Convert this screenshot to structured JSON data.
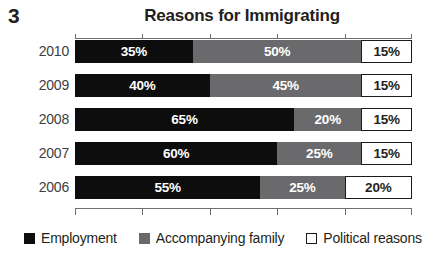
{
  "figure": {
    "number": "3",
    "title": "Reasons for Immigrating"
  },
  "legend": {
    "items": [
      {
        "label": "Employment",
        "swatch": "black-square-icon",
        "color": "#0d0d0d"
      },
      {
        "label": "Accompanying family",
        "swatch": "gray-square-icon",
        "color": "#6a6a6c"
      },
      {
        "label": "Political reasons",
        "swatch": "white-square-icon",
        "color": "#ffffff"
      }
    ]
  },
  "rows": [
    {
      "year": "2010",
      "segments": [
        {
          "series": "Employment",
          "value": 35,
          "label": "35%"
        },
        {
          "series": "Accompanying family",
          "value": 50,
          "label": "50%"
        },
        {
          "series": "Political reasons",
          "value": 15,
          "label": "15%"
        }
      ]
    },
    {
      "year": "2009",
      "segments": [
        {
          "series": "Employment",
          "value": 40,
          "label": "40%"
        },
        {
          "series": "Accompanying family",
          "value": 45,
          "label": "45%"
        },
        {
          "series": "Political reasons",
          "value": 15,
          "label": "15%"
        }
      ]
    },
    {
      "year": "2008",
      "segments": [
        {
          "series": "Employment",
          "value": 65,
          "label": "65%"
        },
        {
          "series": "Accompanying family",
          "value": 20,
          "label": "20%"
        },
        {
          "series": "Political reasons",
          "value": 15,
          "label": "15%"
        }
      ]
    },
    {
      "year": "2007",
      "segments": [
        {
          "series": "Employment",
          "value": 60,
          "label": "60%"
        },
        {
          "series": "Accompanying family",
          "value": 25,
          "label": "25%"
        },
        {
          "series": "Political reasons",
          "value": 15,
          "label": "15%"
        }
      ]
    },
    {
      "year": "2006",
      "segments": [
        {
          "series": "Employment",
          "value": 55,
          "label": "55%"
        },
        {
          "series": "Accompanying family",
          "value": 25,
          "label": "25%"
        },
        {
          "series": "Political reasons",
          "value": 20,
          "label": "20%"
        }
      ]
    }
  ],
  "axis": {
    "ticks": [
      0,
      20,
      40,
      60,
      80,
      100
    ],
    "tick_labels_visible": false
  },
  "chart_data": {
    "type": "bar",
    "orientation": "horizontal",
    "stacked": true,
    "normalized": true,
    "title": "Reasons for Immigrating",
    "xlabel": "",
    "ylabel": "",
    "xlim": [
      0,
      100
    ],
    "grid": false,
    "legend_position": "bottom-left",
    "categories": [
      "2010",
      "2009",
      "2008",
      "2007",
      "2006"
    ],
    "series": [
      {
        "name": "Employment",
        "color": "#0d0d0d",
        "values": [
          35,
          40,
          65,
          60,
          55
        ]
      },
      {
        "name": "Accompanying family",
        "color": "#6a6a6c",
        "values": [
          50,
          45,
          20,
          25,
          25
        ]
      },
      {
        "name": "Political reasons",
        "color": "#ffffff",
        "values": [
          15,
          15,
          15,
          15,
          20
        ]
      }
    ],
    "data_labels": [
      [
        "35%",
        "50%",
        "15%"
      ],
      [
        "40%",
        "45%",
        "15%"
      ],
      [
        "65%",
        "20%",
        "15%"
      ],
      [
        "60%",
        "25%",
        "15%"
      ],
      [
        "55%",
        "25%",
        "20%"
      ]
    ],
    "axis_ticks": [
      0,
      20,
      40,
      60,
      80,
      100
    ]
  }
}
